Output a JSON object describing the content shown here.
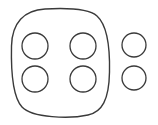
{
  "figure": {
    "title": "Rounded square outline with four inner circles and two outer circles",
    "background_color": "#ffffff",
    "stroke_color": "#3a3a3a",
    "stroke_width": 1.4,
    "canvas": {
      "width": 158,
      "height": 125
    },
    "outer_shape": {
      "name": "rounded-square",
      "type": "squircle",
      "x": 11,
      "y": 9,
      "width": 99,
      "height": 108,
      "corner_radius": 34,
      "fill": "none"
    },
    "inner_circles": {
      "count": 4,
      "arrangement": "2x2 grid",
      "radius": 13,
      "items": [
        {
          "name": "circle-inner-top-left",
          "cx": 35,
          "cy": 46,
          "r": 13
        },
        {
          "name": "circle-inner-top-right",
          "cx": 83,
          "cy": 46,
          "r": 13
        },
        {
          "name": "circle-inner-bottom-left",
          "cx": 35,
          "cy": 79,
          "r": 13
        },
        {
          "name": "circle-inner-bottom-right",
          "cx": 83,
          "cy": 79,
          "r": 13
        }
      ]
    },
    "outer_circles": {
      "count": 2,
      "arrangement": "vertical pair",
      "radius": 12,
      "items": [
        {
          "name": "circle-outer-top",
          "cx": 134,
          "cy": 45,
          "r": 12
        },
        {
          "name": "circle-outer-bottom",
          "cx": 134,
          "cy": 78,
          "r": 12
        }
      ]
    }
  }
}
